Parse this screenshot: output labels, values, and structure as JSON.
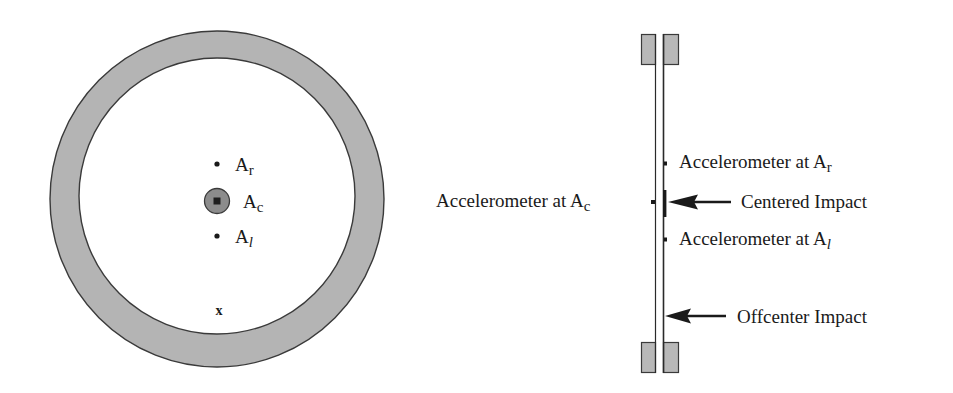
{
  "diagram": {
    "colors": {
      "ring_fill": "#b4b4b4",
      "ring_stroke": "#3a3a3a",
      "sensor_fill": "#8c8c8c",
      "clamp_fill": "#b8b8b8",
      "ink": "#1a1a1a"
    },
    "front_view": {
      "accelerometers": [
        {
          "id": "Ar",
          "base": "A",
          "sub": "r"
        },
        {
          "id": "Ac",
          "base": "A",
          "sub": "c"
        },
        {
          "id": "Al",
          "base": "A",
          "sub": "l"
        }
      ],
      "offcenter_marker": "x"
    },
    "side_view": {
      "labels": {
        "acc_r": {
          "prefix": "Accelerometer at A",
          "sub": "r"
        },
        "acc_c": {
          "prefix": "Accelerometer at A",
          "sub": "c"
        },
        "acc_l": {
          "prefix": "Accelerometer at A",
          "sub": "l"
        },
        "centered_impact": "Centered Impact",
        "offcenter_impact": "Offcenter Impact"
      }
    }
  }
}
